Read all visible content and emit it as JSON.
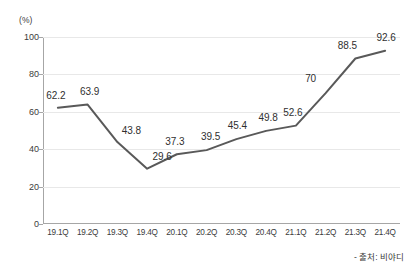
{
  "chart_data": {
    "type": "line",
    "title": "",
    "subtitle": "",
    "xlabel": "",
    "ylabel": "",
    "unit_label": "(%)",
    "categories": [
      "19.1Q",
      "19.2Q",
      "19.3Q",
      "19.4Q",
      "20.1Q",
      "20.2Q",
      "20.3Q",
      "20.4Q",
      "21.1Q",
      "21.2Q",
      "21.3Q",
      "21.4Q"
    ],
    "values": [
      62.2,
      63.9,
      43.8,
      29.6,
      37.3,
      39.5,
      45.4,
      49.8,
      52.6,
      70,
      88.5,
      92.6
    ],
    "value_labels": [
      "62.2",
      "63.9",
      "43.8",
      "29.6",
      "37.3",
      "39.5",
      "45.4",
      "49.8",
      "52.6",
      "70",
      "88.5",
      "92.6"
    ],
    "label_offsets": [
      {
        "dx": -2,
        "dy": -13
      },
      {
        "dx": 2,
        "dy": -14
      },
      {
        "dx": 14,
        "dy": -12
      },
      {
        "dx": 15,
        "dy": -13
      },
      {
        "dx": -2,
        "dy": -13
      },
      {
        "dx": 4,
        "dy": -14
      },
      {
        "dx": 1,
        "dy": -14
      },
      {
        "dx": 2,
        "dy": -14
      },
      {
        "dx": -3,
        "dy": -14
      },
      {
        "dx": -15,
        "dy": -15
      },
      {
        "dx": -8,
        "dy": -14
      },
      {
        "dx": 1,
        "dy": -14
      }
    ],
    "yticks": [
      0,
      20,
      40,
      60,
      80,
      100
    ],
    "ytick_labels": [
      "0",
      "20",
      "40",
      "60",
      "80",
      "100"
    ],
    "ylim": [
      0,
      100
    ],
    "grid": true,
    "legend": "none",
    "series_color": "#595959",
    "grid_color": "#e8e8e8",
    "axis_color": "#a6a6a6",
    "markers": false
  },
  "footer": {
    "source_note": "- 출처: 비야디"
  }
}
